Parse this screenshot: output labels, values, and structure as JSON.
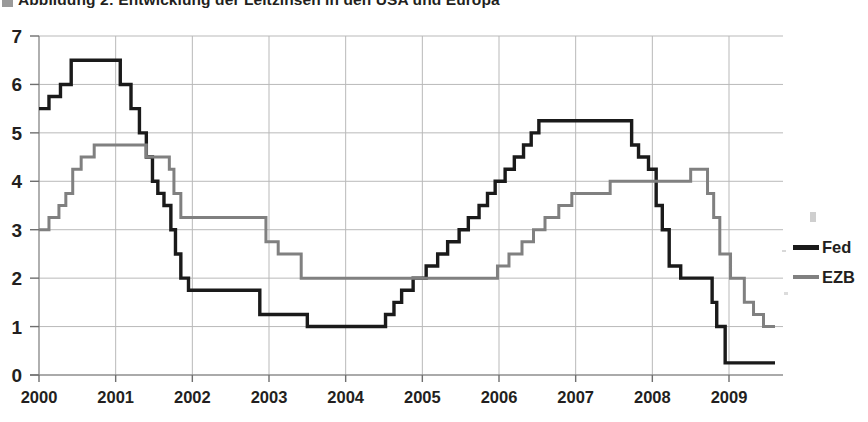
{
  "title": {
    "text": "Abbildung 2: Entwicklung der Leitzinsen in den USA und Europa",
    "bullet_icon": "square-bullet-icon"
  },
  "legend": {
    "position": "right",
    "entries": [
      {
        "label": "Fed",
        "color": "#1a1a1a"
      },
      {
        "label": "EZB",
        "color": "#808080"
      }
    ]
  },
  "axes": {
    "y_ticks": [
      "7",
      "6",
      "5",
      "4",
      "3",
      "2",
      "1",
      "0"
    ],
    "x_ticks": [
      "2000",
      "2001",
      "2002",
      "2003",
      "2004",
      "2005",
      "2006",
      "2007",
      "2008",
      "2009"
    ]
  },
  "chart_data": {
    "type": "line",
    "title": "Abbildung 2: Entwicklung der Leitzinsen in den USA und Europa",
    "xlabel": "",
    "ylabel": "",
    "xlim": [
      2000,
      2009.6
    ],
    "ylim": [
      0,
      7
    ],
    "grid": true,
    "line_style": "step-post",
    "x_tick_values": [
      2000,
      2001,
      2002,
      2003,
      2004,
      2005,
      2006,
      2007,
      2008,
      2009
    ],
    "y_tick_values": [
      0,
      1,
      2,
      3,
      4,
      5,
      6,
      7
    ],
    "legend_position": "right",
    "series": [
      {
        "name": "Fed",
        "color": "#1a1a1a",
        "points": [
          [
            2000.0,
            5.5
          ],
          [
            2000.13,
            5.75
          ],
          [
            2000.28,
            6.0
          ],
          [
            2000.42,
            6.5
          ],
          [
            2001.03,
            6.5
          ],
          [
            2001.06,
            6.0
          ],
          [
            2001.2,
            5.5
          ],
          [
            2001.31,
            5.0
          ],
          [
            2001.4,
            4.5
          ],
          [
            2001.48,
            4.0
          ],
          [
            2001.55,
            3.75
          ],
          [
            2001.63,
            3.5
          ],
          [
            2001.72,
            3.0
          ],
          [
            2001.78,
            2.5
          ],
          [
            2001.85,
            2.0
          ],
          [
            2001.95,
            1.75
          ],
          [
            2002.88,
            1.25
          ],
          [
            2003.5,
            1.0
          ],
          [
            2004.52,
            1.25
          ],
          [
            2004.63,
            1.5
          ],
          [
            2004.73,
            1.75
          ],
          [
            2004.88,
            2.0
          ],
          [
            2005.05,
            2.25
          ],
          [
            2005.2,
            2.5
          ],
          [
            2005.33,
            2.75
          ],
          [
            2005.48,
            3.0
          ],
          [
            2005.6,
            3.25
          ],
          [
            2005.74,
            3.5
          ],
          [
            2005.85,
            3.75
          ],
          [
            2005.95,
            4.0
          ],
          [
            2006.08,
            4.25
          ],
          [
            2006.2,
            4.5
          ],
          [
            2006.32,
            4.75
          ],
          [
            2006.42,
            5.0
          ],
          [
            2006.52,
            5.25
          ],
          [
            2007.7,
            5.25
          ],
          [
            2007.73,
            4.75
          ],
          [
            2007.82,
            4.5
          ],
          [
            2007.95,
            4.25
          ],
          [
            2008.05,
            3.5
          ],
          [
            2008.13,
            3.0
          ],
          [
            2008.22,
            2.25
          ],
          [
            2008.37,
            2.0
          ],
          [
            2008.78,
            1.5
          ],
          [
            2008.84,
            1.0
          ],
          [
            2008.95,
            0.25
          ],
          [
            2009.6,
            0.25
          ]
        ]
      },
      {
        "name": "EZB",
        "color": "#808080",
        "points": [
          [
            2000.0,
            3.0
          ],
          [
            2000.13,
            3.25
          ],
          [
            2000.26,
            3.5
          ],
          [
            2000.35,
            3.75
          ],
          [
            2000.44,
            4.25
          ],
          [
            2000.55,
            4.5
          ],
          [
            2000.72,
            4.75
          ],
          [
            2001.35,
            4.75
          ],
          [
            2001.4,
            4.5
          ],
          [
            2001.7,
            4.25
          ],
          [
            2001.76,
            3.75
          ],
          [
            2001.85,
            3.25
          ],
          [
            2002.88,
            3.25
          ],
          [
            2002.96,
            2.75
          ],
          [
            2003.12,
            2.5
          ],
          [
            2003.42,
            2.0
          ],
          [
            2005.92,
            2.0
          ],
          [
            2005.98,
            2.25
          ],
          [
            2006.13,
            2.5
          ],
          [
            2006.3,
            2.75
          ],
          [
            2006.45,
            3.0
          ],
          [
            2006.6,
            3.25
          ],
          [
            2006.78,
            3.5
          ],
          [
            2006.95,
            3.75
          ],
          [
            2007.45,
            4.0
          ],
          [
            2008.42,
            4.0
          ],
          [
            2008.5,
            4.25
          ],
          [
            2008.72,
            3.75
          ],
          [
            2008.8,
            3.25
          ],
          [
            2008.88,
            2.5
          ],
          [
            2009.02,
            2.0
          ],
          [
            2009.2,
            1.5
          ],
          [
            2009.32,
            1.25
          ],
          [
            2009.45,
            1.0
          ],
          [
            2009.6,
            1.0
          ]
        ]
      }
    ]
  }
}
